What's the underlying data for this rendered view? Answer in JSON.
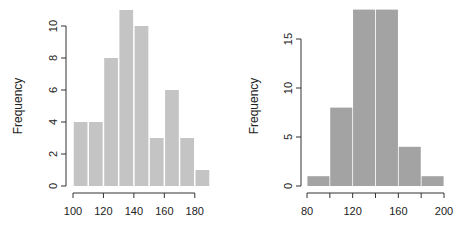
{
  "chart_data": [
    {
      "type": "bar",
      "subtype": "histogram",
      "title": "",
      "xlabel": "",
      "ylabel": "Frequency",
      "bar_color": "#c4c4c4",
      "bins": [
        {
          "from": 100,
          "to": 110,
          "value": 4
        },
        {
          "from": 110,
          "to": 120,
          "value": 4
        },
        {
          "from": 120,
          "to": 130,
          "value": 8
        },
        {
          "from": 130,
          "to": 140,
          "value": 11
        },
        {
          "from": 140,
          "to": 150,
          "value": 10
        },
        {
          "from": 150,
          "to": 160,
          "value": 3
        },
        {
          "from": 160,
          "to": 170,
          "value": 6
        },
        {
          "from": 170,
          "to": 180,
          "value": 3
        },
        {
          "from": 180,
          "to": 190,
          "value": 1
        }
      ],
      "xlim": [
        100,
        190
      ],
      "ylim": [
        0,
        11
      ],
      "x_ticks": [
        100,
        120,
        140,
        160,
        180
      ],
      "y_ticks": [
        0,
        2,
        4,
        6,
        8,
        10
      ],
      "grid": false
    },
    {
      "type": "bar",
      "subtype": "histogram",
      "title": "",
      "xlabel": "",
      "ylabel": "Frequency",
      "bar_color": "#a3a3a3",
      "bins": [
        {
          "from": 80,
          "to": 100,
          "value": 1
        },
        {
          "from": 100,
          "to": 120,
          "value": 8
        },
        {
          "from": 120,
          "to": 140,
          "value": 18
        },
        {
          "from": 140,
          "to": 160,
          "value": 18
        },
        {
          "from": 160,
          "to": 180,
          "value": 4
        },
        {
          "from": 180,
          "to": 200,
          "value": 1
        }
      ],
      "xlim": [
        80,
        200
      ],
      "ylim": [
        0,
        18
      ],
      "x_ticks": [
        80,
        100,
        120,
        140,
        160,
        180,
        200
      ],
      "x_tick_labels": [
        "80",
        "",
        "120",
        "",
        "160",
        "",
        "200"
      ],
      "y_ticks": [
        0,
        5,
        10,
        15
      ],
      "grid": false
    }
  ]
}
